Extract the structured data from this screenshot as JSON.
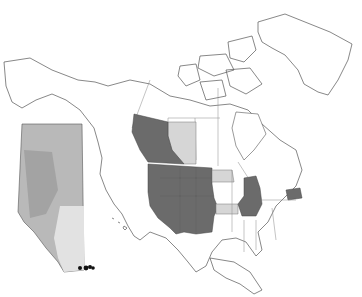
{
  "map": {
    "title": "",
    "type": "distribution-map",
    "regions": {
      "present_dark": [
        "British Columbia",
        "Washington",
        "Oregon",
        "California",
        "Idaho",
        "Nevada",
        "Utah",
        "Arizona",
        "Montana",
        "Wyoming",
        "Colorado",
        "New Mexico",
        "South Dakota",
        "Nebraska",
        "Wisconsin",
        "Illinois",
        "Missouri",
        "Pennsylvania"
      ],
      "present_light": [
        "Alberta",
        "North Dakota",
        "Kansas"
      ]
    },
    "inset": {
      "region": "Alberta",
      "points": 4
    },
    "scale_label": "",
    "colors": {
      "dark": "#6b6b6b",
      "light": "#d6d6d6",
      "inset": "#b9b9b9",
      "points": "#111111"
    }
  }
}
